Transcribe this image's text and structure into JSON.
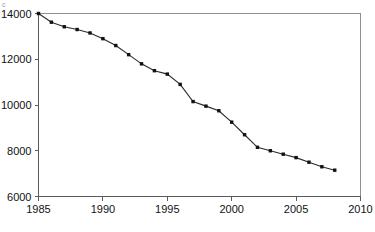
{
  "chart_data": {
    "type": "line",
    "title": "",
    "subtitle": "",
    "xlabel": "",
    "ylabel": "",
    "xlim": [
      1985,
      2010
    ],
    "ylim": [
      6000,
      14000
    ],
    "grid": false,
    "legend": null,
    "legend_position": "none",
    "x_ticks": [
      "1985",
      "1990",
      "1995",
      "2000",
      "2005",
      "2010"
    ],
    "x_tick_values": [
      1985,
      1990,
      1995,
      2000,
      2005,
      2010
    ],
    "y_ticks": [
      "6000",
      "8000",
      "10000",
      "12000",
      "14000"
    ],
    "y_tick_values": [
      6000,
      8000,
      10000,
      12000,
      14000
    ],
    "marker": "square",
    "marker_color": "#111111",
    "line_color": "#2a2a2a",
    "series": [
      {
        "name": "series-1",
        "x": [
          1985,
          1986,
          1987,
          1988,
          1989,
          1990,
          1991,
          1992,
          1993,
          1994,
          1995,
          1996,
          1997,
          1998,
          1999,
          2000,
          2001,
          2002,
          2003,
          2004,
          2005,
          2006,
          2007,
          2008
        ],
        "values": [
          14000,
          13620,
          13420,
          13300,
          13150,
          12900,
          12600,
          12200,
          11800,
          11500,
          11350,
          10900,
          10150,
          9950,
          9750,
          9250,
          8700,
          8150,
          8000,
          7850,
          7700,
          7500,
          7300,
          7150
        ]
      }
    ]
  },
  "annotations": {
    "top_left_mark": "c"
  }
}
